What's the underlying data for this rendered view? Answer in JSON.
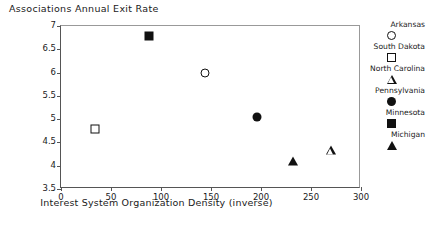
{
  "chart_data": {
    "type": "scatter",
    "title": "Associations Annual Exit Rate",
    "xlabel": "Interest System Organization Density (inverse)",
    "ylabel": "",
    "xlim": [
      0,
      300
    ],
    "ylim": [
      3.5,
      7
    ],
    "xticks": [
      0,
      50,
      100,
      150,
      200,
      250,
      300
    ],
    "yticks": [
      3.5,
      4,
      4.5,
      5,
      5.5,
      6,
      6.5,
      7
    ],
    "grid": false,
    "legend_position": "right",
    "series": [
      {
        "name": "Arkansas",
        "marker": "circle-open",
        "x": [
          144
        ],
        "y": [
          6.0
        ]
      },
      {
        "name": "South Dakota",
        "marker": "square-open",
        "x": [
          34
        ],
        "y": [
          4.78
        ]
      },
      {
        "name": "North Carolina",
        "marker": "triangle-open",
        "x": [
          270
        ],
        "y": [
          4.33
        ]
      },
      {
        "name": "Pennsylvania",
        "marker": "circle-filled",
        "x": [
          196
        ],
        "y": [
          5.04
        ]
      },
      {
        "name": "Minnesota",
        "marker": "square-filled",
        "x": [
          88
        ],
        "y": [
          6.78
        ]
      },
      {
        "name": "Michigan",
        "marker": "triangle-filled",
        "x": [
          232
        ],
        "y": [
          4.1
        ]
      }
    ]
  },
  "axis": {
    "x_tick_labels": [
      "0",
      "50",
      "100",
      "150",
      "200",
      "250",
      "300"
    ],
    "y_tick_labels": [
      "3.5",
      "4",
      "4.5",
      "5",
      "5.5",
      "6",
      "6.5",
      "7"
    ]
  },
  "legend": {
    "entries": [
      {
        "label": "Arkansas",
        "marker": "circle-open"
      },
      {
        "label": "South Dakota",
        "marker": "square-open"
      },
      {
        "label": "North Carolina",
        "marker": "triangle-open"
      },
      {
        "label": "Pennsylvania",
        "marker": "circle-filled"
      },
      {
        "label": "Minnesota",
        "marker": "square-filled"
      },
      {
        "label": "Michigan",
        "marker": "triangle-filled"
      }
    ]
  },
  "colors": {
    "marker": "#111111",
    "axis": "#555555",
    "text": "#1a1a1a",
    "background": "#ffffff"
  }
}
